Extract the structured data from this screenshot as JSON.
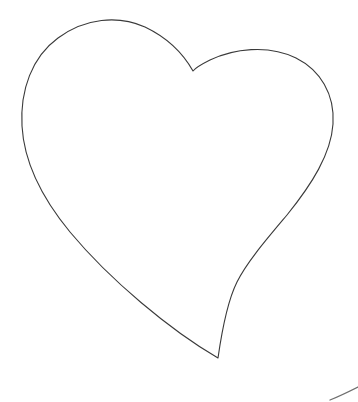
{
  "canvas": {
    "width": 358,
    "height": 402,
    "background_color": "#ffffff",
    "title": "Heart Outline"
  },
  "style": {
    "stroke_color": "#3a3a3a",
    "fill_color": "#ffffff",
    "stroke_width": 1.1,
    "accent_color": "#555555"
  },
  "shapes": [
    {
      "name": "heart-outline",
      "type": "closed-path",
      "description": "Hand-drawn heart outline, unfilled line art",
      "key_points": {
        "left_lobe_peak": [
          135,
          25
        ],
        "left_extremity": [
          22,
          135
        ],
        "cleft_notch": [
          193,
          71
        ],
        "right_lobe_peak": [
          255,
          55
        ],
        "right_extremity": [
          333,
          125
        ],
        "right_inflection": [
          245,
          268
        ],
        "bottom_tip": [
          218,
          358
        ]
      },
      "path": "M 193 71 C 184 55 168 38 145 27 C 118 15 85 18 58 38 C 32 57 20 90 22 126 C 24 162 42 198 70 232 C 110 280 170 330 218 358 C 222 330 228 300 237 282 C 247 262 266 240 287 215 C 312 184 331 154 333 124 C 335 94 320 70 296 58 C 268 44 233 49 210 60 C 202 64 196 67 193 71 Z"
    },
    {
      "name": "corner-arc-fragment",
      "type": "open-path",
      "description": "Faint partial arc cropped at the bottom-right corner of the frame",
      "key_points": {
        "start": [
          330,
          399
        ],
        "end": [
          358,
          388
        ]
      },
      "path": "M 330 400 C 340 396 350 391 358 387"
    }
  ]
}
